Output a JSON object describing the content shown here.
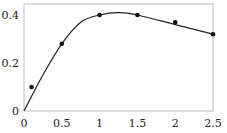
{
  "chart_data": {
    "type": "scatter",
    "title": "",
    "xlabel": "",
    "ylabel": "",
    "xlim": [
      0,
      2.5
    ],
    "ylim": [
      0,
      0.42
    ],
    "grid": false,
    "legend": null,
    "x_ticks": [
      "0",
      "0.5",
      "1",
      "1.5",
      "2",
      "2.5"
    ],
    "y_ticks": [
      "0",
      "0.2",
      "0.4"
    ],
    "series": [
      {
        "name": "data",
        "kind": "scatter",
        "x": [
          0.1,
          0.5,
          1.0,
          1.5,
          2.0,
          2.5
        ],
        "y": [
          0.1,
          0.28,
          0.4,
          0.4,
          0.37,
          0.32
        ]
      },
      {
        "name": "fit",
        "kind": "line",
        "x": [
          0,
          0.25,
          0.5,
          0.75,
          1.0,
          1.25,
          1.5,
          2.0,
          2.5
        ],
        "y": [
          0,
          0.15,
          0.28,
          0.37,
          0.4,
          0.41,
          0.4,
          0.36,
          0.32
        ]
      }
    ]
  }
}
